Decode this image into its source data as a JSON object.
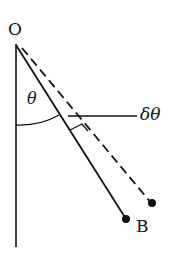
{
  "diagram": {
    "labels": {
      "pivot": "O",
      "angle": "θ",
      "delta_angle": "δθ",
      "bob": "B"
    },
    "elements": [
      {
        "type": "vertical-reference-line",
        "description": "Vertical line through pivot O"
      },
      {
        "type": "pendulum-rod-solid",
        "description": "Solid rod from O to bob B at angle θ"
      },
      {
        "type": "pendulum-rod-dashed",
        "description": "Dashed displaced rod at angle θ+δθ"
      },
      {
        "type": "angle-arc",
        "description": "Arc marking θ between vertical and rod"
      },
      {
        "type": "small-angle-marker",
        "description": "Marker for δθ between solid and dashed rods"
      }
    ],
    "stroke_color": "#111111"
  }
}
